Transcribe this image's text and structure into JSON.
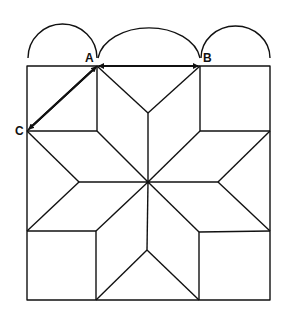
{
  "diagram": {
    "title": "",
    "labels": {
      "A": "A",
      "B": "B",
      "C": "C"
    },
    "colors": {
      "line": "#111111",
      "background": "#ffffff"
    },
    "points": {
      "A": [
        97,
        66
      ],
      "B": [
        200,
        66
      ],
      "C": [
        27,
        131
      ],
      "center": [
        148,
        182
      ]
    },
    "arrows": [
      {
        "from": "A",
        "to": "B",
        "bidirectional": true
      },
      {
        "from": "A",
        "to": "C",
        "bidirectional": true
      }
    ]
  }
}
